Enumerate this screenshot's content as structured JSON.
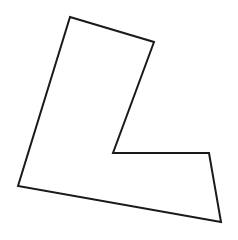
{
  "canvas": {
    "width": 238,
    "height": 240,
    "background": "#ffffff"
  },
  "shape": {
    "type": "polygon",
    "description": "L-shaped hexagon outline",
    "stroke": "#1a1a1a",
    "stroke_width": 2,
    "fill": "none",
    "points": "70,17 154,42 113,153 209,153 221,222 18,186"
  }
}
